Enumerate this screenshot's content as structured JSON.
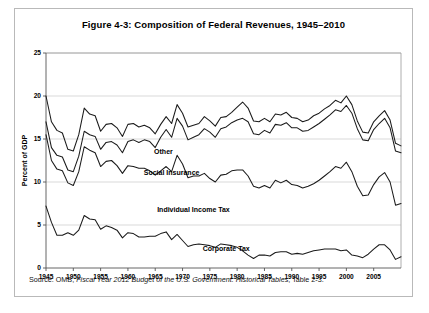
{
  "figure": {
    "title": "Figure 4-3: Composition of Federal Revenues, 1945–2010",
    "source_prefix": "Source: OMB, ",
    "source_italic": "Fiscal Year 2012 Budget of the U.S. Government: Historical Tables",
    "source_suffix": ", Table 2-3."
  },
  "chart_data": {
    "type": "line",
    "title": "Figure 4-3: Composition of Federal Revenues, 1945–2010",
    "xlabel": "",
    "ylabel": "Percent of GDP",
    "xlim": [
      1945,
      2010
    ],
    "ylim": [
      0,
      25
    ],
    "ytick_values": [
      0,
      5,
      10,
      15,
      20,
      25
    ],
    "ytick_labels": [
      "0",
      "5",
      "10",
      "15",
      "20",
      "25"
    ],
    "xtick_values": [
      1945,
      1950,
      1955,
      1960,
      1965,
      1970,
      1975,
      1980,
      1985,
      1990,
      1995,
      2000,
      2005
    ],
    "xtick_labels": [
      "1945",
      "1950",
      "1955",
      "1960",
      "1965",
      "1970",
      "1975",
      "1980",
      "1985",
      "1990",
      "1995",
      "2000",
      "2005"
    ],
    "grid": true,
    "grid_axis": "y",
    "stacked_cumulative": true,
    "legend_position": "inline-annotations",
    "annotations": [
      {
        "text": "Other",
        "x": 1966.5,
        "y": 13.3
      },
      {
        "text": "Social Insurance",
        "x": 1968.0,
        "y": 10.8
      },
      {
        "text": "Individual Income Tax",
        "x": 1972.0,
        "y": 6.5
      },
      {
        "text": "Corporate Tax",
        "x": 1978.0,
        "y": 2.0
      }
    ],
    "x": [
      1945,
      1946,
      1947,
      1948,
      1949,
      1950,
      1951,
      1952,
      1953,
      1954,
      1955,
      1956,
      1957,
      1958,
      1959,
      1960,
      1961,
      1962,
      1963,
      1964,
      1965,
      1966,
      1967,
      1968,
      1969,
      1970,
      1971,
      1972,
      1973,
      1974,
      1975,
      1976,
      1977,
      1978,
      1979,
      1980,
      1981,
      1982,
      1983,
      1984,
      1985,
      1986,
      1987,
      1988,
      1989,
      1990,
      1991,
      1992,
      1993,
      1994,
      1995,
      1996,
      1997,
      1998,
      1999,
      2000,
      2001,
      2002,
      2003,
      2004,
      2005,
      2006,
      2007,
      2008,
      2009,
      2010
    ],
    "series": [
      {
        "name": "Corporate Tax",
        "order": 1,
        "values": [
          7.2,
          5.3,
          3.8,
          3.8,
          4.1,
          3.8,
          4.4,
          6.1,
          5.7,
          5.6,
          4.5,
          4.9,
          4.7,
          4.4,
          3.5,
          4.1,
          4.0,
          3.6,
          3.6,
          3.7,
          3.7,
          4.0,
          4.2,
          3.3,
          3.9,
          3.2,
          2.5,
          2.7,
          2.8,
          2.7,
          2.6,
          2.4,
          2.8,
          2.7,
          2.6,
          2.4,
          2.0,
          1.5,
          1.1,
          1.5,
          1.5,
          1.4,
          1.8,
          1.9,
          1.9,
          1.6,
          1.7,
          1.6,
          1.8,
          2.0,
          2.1,
          2.2,
          2.2,
          2.2,
          2.0,
          2.1,
          1.5,
          1.4,
          1.2,
          1.6,
          2.2,
          2.7,
          2.7,
          2.1,
          1.0,
          1.3
        ]
      },
      {
        "name": "Individual Income Tax",
        "order": 2,
        "values": [
          8.3,
          7.2,
          7.7,
          7.5,
          5.8,
          5.8,
          6.8,
          8.0,
          8.0,
          7.8,
          7.3,
          7.5,
          7.8,
          7.5,
          7.5,
          7.8,
          7.8,
          8.0,
          8.0,
          7.6,
          7.1,
          7.3,
          7.6,
          7.9,
          9.2,
          8.9,
          8.0,
          8.0,
          7.9,
          8.3,
          7.8,
          7.6,
          8.0,
          8.2,
          8.7,
          9.0,
          9.4,
          9.2,
          8.4,
          7.8,
          8.1,
          7.9,
          8.4,
          8.0,
          8.3,
          8.1,
          7.9,
          7.7,
          7.7,
          7.8,
          8.1,
          8.5,
          9.0,
          9.6,
          9.6,
          10.2,
          9.7,
          8.1,
          7.2,
          6.9,
          7.5,
          7.9,
          8.4,
          7.9,
          6.3,
          6.2
        ]
      },
      {
        "name": "Social Insurance",
        "order": 3,
        "values": [
          1.5,
          1.5,
          1.6,
          1.6,
          1.5,
          1.6,
          1.8,
          1.8,
          1.8,
          1.9,
          2.0,
          2.2,
          2.2,
          2.4,
          2.4,
          2.8,
          3.1,
          3.0,
          3.3,
          3.4,
          3.2,
          3.9,
          4.3,
          4.0,
          4.3,
          4.4,
          4.4,
          4.5,
          4.8,
          5.2,
          5.4,
          5.2,
          5.4,
          5.5,
          5.6,
          5.8,
          6.0,
          6.3,
          6.1,
          6.2,
          6.4,
          6.4,
          6.5,
          6.7,
          6.7,
          6.6,
          6.7,
          6.6,
          6.5,
          6.6,
          6.6,
          6.6,
          6.6,
          6.6,
          6.6,
          6.6,
          6.8,
          6.7,
          6.5,
          6.3,
          6.4,
          6.2,
          6.3,
          6.3,
          6.3,
          5.9
        ]
      },
      {
        "name": "Other",
        "order": 4,
        "values": [
          3.0,
          3.0,
          2.9,
          2.8,
          2.4,
          2.4,
          2.5,
          2.7,
          2.4,
          2.4,
          2.1,
          2.1,
          2.1,
          2.0,
          1.9,
          2.0,
          1.9,
          1.8,
          1.7,
          1.6,
          1.6,
          1.5,
          1.5,
          1.6,
          1.6,
          1.5,
          1.5,
          1.4,
          1.3,
          1.4,
          1.3,
          1.3,
          1.3,
          1.2,
          1.2,
          1.5,
          1.9,
          1.6,
          1.5,
          1.5,
          1.4,
          1.3,
          1.2,
          1.2,
          1.2,
          1.2,
          1.1,
          1.1,
          1.2,
          1.3,
          1.2,
          1.2,
          1.1,
          1.1,
          1.0,
          1.1,
          1.0,
          0.9,
          0.9,
          0.9,
          0.9,
          0.9,
          0.9,
          0.9,
          0.9,
          0.8
        ]
      }
    ],
    "cumulative_lines": [
      {
        "name": "Corporate Tax (cumulative)",
        "values": [
          7.2,
          5.3,
          3.8,
          3.8,
          4.1,
          3.8,
          4.4,
          6.1,
          5.7,
          5.6,
          4.5,
          4.9,
          4.7,
          4.4,
          3.5,
          4.1,
          4.0,
          3.6,
          3.6,
          3.7,
          3.7,
          4.0,
          4.2,
          3.3,
          3.9,
          3.2,
          2.5,
          2.7,
          2.8,
          2.7,
          2.6,
          2.4,
          2.8,
          2.7,
          2.6,
          2.4,
          2.0,
          1.5,
          1.1,
          1.5,
          1.5,
          1.4,
          1.8,
          1.9,
          1.9,
          1.6,
          1.7,
          1.6,
          1.8,
          2.0,
          2.1,
          2.2,
          2.2,
          2.2,
          2.0,
          2.1,
          1.5,
          1.4,
          1.2,
          1.6,
          2.2,
          2.7,
          2.7,
          2.1,
          1.0,
          1.3
        ]
      },
      {
        "name": "+ Individual Income Tax",
        "values": [
          15.5,
          12.5,
          11.5,
          11.3,
          9.9,
          9.6,
          11.2,
          14.1,
          13.7,
          13.4,
          11.8,
          12.4,
          12.5,
          11.9,
          11.0,
          11.9,
          11.8,
          11.6,
          11.6,
          11.3,
          10.8,
          11.3,
          11.8,
          11.2,
          13.1,
          12.1,
          10.5,
          10.7,
          10.7,
          11.0,
          10.4,
          10.0,
          10.8,
          10.9,
          11.3,
          11.4,
          11.4,
          10.7,
          9.5,
          9.3,
          9.6,
          9.3,
          10.2,
          9.9,
          10.2,
          9.7,
          9.6,
          9.3,
          9.5,
          9.8,
          10.2,
          10.7,
          11.2,
          11.8,
          11.6,
          12.3,
          11.2,
          9.5,
          8.4,
          8.5,
          9.7,
          10.6,
          11.1,
          10.0,
          7.3,
          7.5
        ]
      },
      {
        "name": "+ Social Insurance",
        "values": [
          17.0,
          14.0,
          13.1,
          12.9,
          11.4,
          11.2,
          13.0,
          15.9,
          15.5,
          15.3,
          13.8,
          14.6,
          14.7,
          14.3,
          13.4,
          14.7,
          14.9,
          14.6,
          14.9,
          14.7,
          14.0,
          15.2,
          16.1,
          15.2,
          17.4,
          16.5,
          14.9,
          15.2,
          15.5,
          16.2,
          15.8,
          15.2,
          16.2,
          16.4,
          16.9,
          17.2,
          17.4,
          17.0,
          15.6,
          15.5,
          16.0,
          15.7,
          16.7,
          16.6,
          16.9,
          16.3,
          16.3,
          15.9,
          16.0,
          16.4,
          16.8,
          17.3,
          17.8,
          18.4,
          18.2,
          18.9,
          18.0,
          16.2,
          14.9,
          14.8,
          16.1,
          16.8,
          17.4,
          16.3,
          13.6,
          13.4
        ]
      },
      {
        "name": "+ Other (Total Revenue)",
        "values": [
          20.0,
          17.0,
          16.0,
          15.7,
          13.8,
          13.6,
          15.5,
          18.6,
          17.9,
          17.7,
          15.9,
          16.7,
          16.8,
          16.3,
          15.3,
          16.7,
          16.8,
          16.4,
          16.6,
          16.3,
          15.6,
          16.7,
          17.6,
          16.8,
          19.0,
          18.0,
          16.4,
          16.6,
          16.8,
          17.6,
          17.1,
          16.5,
          17.5,
          17.6,
          18.1,
          18.7,
          19.3,
          18.6,
          17.1,
          17.0,
          17.4,
          17.0,
          17.9,
          17.8,
          18.1,
          17.5,
          17.4,
          17.0,
          17.2,
          17.7,
          18.0,
          18.5,
          18.9,
          19.5,
          19.2,
          20.0,
          19.0,
          17.1,
          15.8,
          15.7,
          17.0,
          17.7,
          18.3,
          17.2,
          14.5,
          14.2
        ]
      }
    ]
  }
}
